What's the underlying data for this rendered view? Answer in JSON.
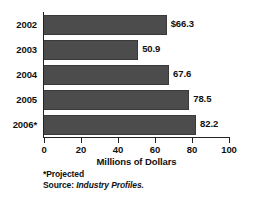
{
  "chart_data": {
    "type": "bar",
    "orientation": "horizontal",
    "title": "",
    "xlabel": "Millions of Dollars",
    "ylabel": "",
    "categories": [
      "2002",
      "2003",
      "2004",
      "2005",
      "2006*"
    ],
    "values": [
      66.3,
      50.9,
      67.6,
      78.5,
      82.2
    ],
    "data_labels": [
      "$66.3",
      "50.9",
      "67.6",
      "78.5",
      "82.2"
    ],
    "xlim": [
      0,
      100
    ],
    "xticks": [
      0,
      20,
      40,
      60,
      80,
      100
    ],
    "xtick_labels": [
      "0",
      "20",
      "40",
      "60",
      "80",
      "100"
    ],
    "grid": false,
    "legend": null,
    "series": [
      {
        "name": "Millions of Dollars",
        "values": [
          66.3,
          50.9,
          67.6,
          78.5,
          82.2
        ],
        "color": "#4c4c4c"
      }
    ],
    "annotations": {
      "projected_note": "*Projected",
      "source_label": "Source:",
      "source_value": "Industry Profiles."
    },
    "colors": {
      "bar_fill": "#4c4c4c",
      "bar_stroke": "#3a3a3a",
      "axis": "#222222",
      "text": "#111111",
      "background": "#ffffff"
    }
  }
}
